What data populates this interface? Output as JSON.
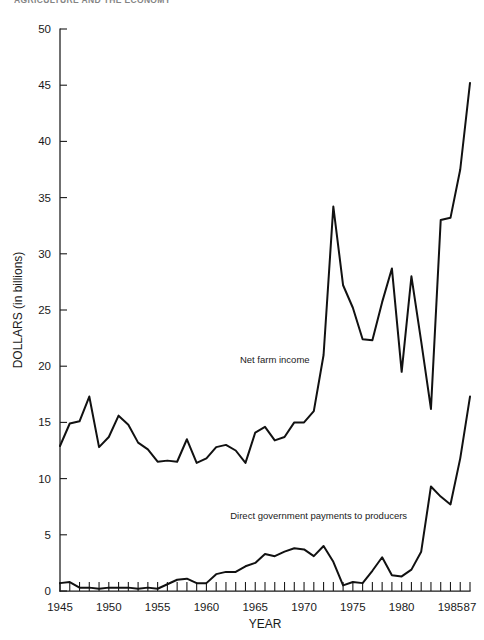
{
  "page": {
    "running_head": "AGRICULTURE AND THE ECONOMY"
  },
  "chart_data": {
    "type": "line",
    "title": "",
    "xlabel": "YEAR",
    "ylabel": "DOLLARS (in billions)",
    "xlim": [
      1945,
      1987
    ],
    "ylim": [
      0,
      50
    ],
    "grid": false,
    "legend": "inline-annotations",
    "y_ticks": [
      0,
      5,
      10,
      15,
      20,
      25,
      30,
      35,
      40,
      45,
      50
    ],
    "y_tick_labels": [
      "0",
      "5",
      "10",
      "15",
      "20",
      "25",
      "30",
      "35",
      "40",
      "45",
      "50"
    ],
    "x_ticks": [
      1945,
      1946,
      1947,
      1948,
      1949,
      1950,
      1951,
      1952,
      1953,
      1954,
      1955,
      1956,
      1957,
      1958,
      1959,
      1960,
      1961,
      1962,
      1963,
      1964,
      1965,
      1966,
      1967,
      1968,
      1969,
      1970,
      1971,
      1972,
      1973,
      1974,
      1975,
      1976,
      1977,
      1978,
      1979,
      1980,
      1981,
      1982,
      1983,
      1984,
      1985,
      1986,
      1987
    ],
    "x_tick_labels": [
      {
        "value": 1945,
        "label": "1945"
      },
      {
        "value": 1950,
        "label": "1950"
      },
      {
        "value": 1955,
        "label": "1955"
      },
      {
        "value": 1960,
        "label": "1960"
      },
      {
        "value": 1965,
        "label": "1965"
      },
      {
        "value": 1970,
        "label": "1970"
      },
      {
        "value": 1975,
        "label": "1975"
      },
      {
        "value": 1980,
        "label": "1980"
      },
      {
        "value": 1985,
        "label": "1985"
      },
      {
        "value": 1987,
        "label": "87"
      }
    ],
    "x": [
      1945,
      1946,
      1947,
      1948,
      1949,
      1950,
      1951,
      1952,
      1953,
      1954,
      1955,
      1956,
      1957,
      1958,
      1959,
      1960,
      1961,
      1962,
      1963,
      1964,
      1965,
      1966,
      1967,
      1968,
      1969,
      1970,
      1971,
      1972,
      1973,
      1974,
      1975,
      1976,
      1977,
      1978,
      1979,
      1980,
      1981,
      1982,
      1983,
      1984,
      1985,
      1986,
      1987
    ],
    "series": [
      {
        "name": "Net farm income",
        "annotation": "Net farm income",
        "annotation_x": 1967,
        "annotation_y": 20.3,
        "values": [
          12.9,
          14.9,
          15.1,
          17.3,
          12.8,
          13.7,
          15.6,
          14.8,
          13.2,
          12.6,
          11.5,
          11.6,
          11.5,
          13.5,
          11.4,
          11.8,
          12.8,
          13.0,
          12.5,
          11.4,
          14.1,
          14.6,
          13.4,
          13.7,
          15.0,
          15.0,
          16.0,
          21.0,
          34.2,
          27.2,
          25.2,
          22.4,
          22.3,
          25.7,
          28.7,
          19.5,
          28.0,
          22.2,
          16.2,
          33.0,
          33.2,
          37.5,
          45.2
        ]
      },
      {
        "name": "Direct government payments to producers",
        "annotation": "Direct government payments to producers",
        "annotation_x": 1971.5,
        "annotation_y": 6.4,
        "values": [
          0.7,
          0.8,
          0.3,
          0.3,
          0.2,
          0.3,
          0.3,
          0.3,
          0.2,
          0.3,
          0.2,
          0.6,
          1.0,
          1.1,
          0.7,
          0.7,
          1.5,
          1.7,
          1.7,
          2.2,
          2.5,
          3.3,
          3.1,
          3.5,
          3.8,
          3.7,
          3.1,
          4.0,
          2.6,
          0.5,
          0.8,
          0.7,
          1.8,
          3.0,
          1.4,
          1.3,
          1.9,
          3.5,
          9.3,
          8.4,
          7.7,
          11.8,
          17.3
        ]
      }
    ]
  }
}
